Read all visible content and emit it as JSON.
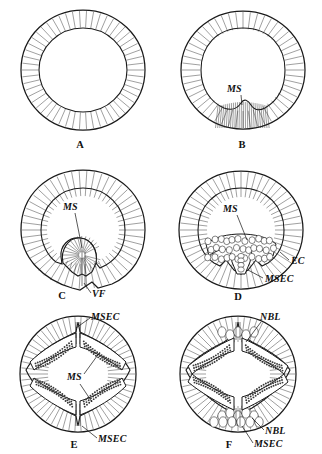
{
  "figure": {
    "name": "mesoderm-formation-cross-sections",
    "background_color": "#ffffff",
    "ink_color": "#1a1a1a",
    "panel_count": 6,
    "columns": 2,
    "rows": 3
  },
  "panels": [
    {
      "id": "A",
      "letter": "A",
      "stage_description": "uniform blastoderm ring of columnar epithelial cells, no differentiation",
      "labels": []
    },
    {
      "id": "B",
      "letter": "B",
      "stage_description": "ventral plate thickening, mesoderm anlage forming at ventral midline",
      "labels": [
        {
          "text": "MS",
          "meaning": "mesoderm",
          "position": "inner-ventral"
        }
      ]
    },
    {
      "id": "C",
      "letter": "C",
      "stage_description": "deep ventral invagination forming a pouch, ventral furrow closing",
      "labels": [
        {
          "text": "MS",
          "meaning": "mesoderm",
          "position": "inner-center"
        },
        {
          "text": "VF",
          "meaning": "ventral furrow",
          "position": "ventral-bottom-right"
        }
      ]
    },
    {
      "id": "D",
      "letter": "D",
      "stage_description": "invaginated mesoderm mass detached, ectoderm closed over ventrally",
      "labels": [
        {
          "text": "MS",
          "meaning": "mesoderm",
          "position": "inner-center"
        },
        {
          "text": "EC",
          "meaning": "ectoderm",
          "position": "right-outer"
        },
        {
          "text": "MSEC",
          "meaning": "mesectoderm",
          "position": "lower-right"
        }
      ]
    },
    {
      "id": "E",
      "letter": "E",
      "stage_description": "mesoderm spread into bilateral paired bands beneath ectoderm, dorsal and ventral mesectoderm",
      "labels": [
        {
          "text": "MSEC",
          "meaning": "mesectoderm",
          "position": "top-right"
        },
        {
          "text": "MS",
          "meaning": "mesoderm",
          "position": "center"
        },
        {
          "text": "MSEC",
          "meaning": "mesectoderm",
          "position": "bottom-right"
        }
      ]
    },
    {
      "id": "F",
      "letter": "F",
      "stage_description": "neuroblasts segregating from ectoderm, mesoderm bands flanking, germ band stage",
      "labels": [
        {
          "text": "NBL",
          "meaning": "neuroblasts",
          "position": "top-right"
        },
        {
          "text": "NBL",
          "meaning": "neuroblasts",
          "position": "bottom-right"
        },
        {
          "text": "MSEC",
          "meaning": "mesectoderm",
          "position": "bottom-right-lower"
        }
      ]
    }
  ],
  "legend_terms": {
    "MS": "mesoderm",
    "VF": "ventral furrow",
    "EC": "ectoderm",
    "MSEC": "mesectoderm",
    "NBL": "neuroblasts"
  }
}
